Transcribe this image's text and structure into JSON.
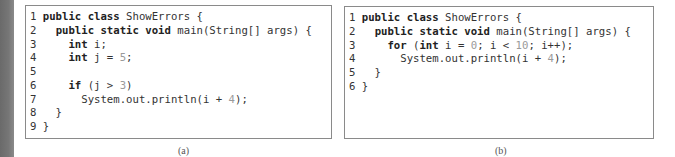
{
  "figure_a": {
    "caption": "(a)",
    "lines": [
      {
        "n": "1",
        "tokens": [
          [
            "kw",
            "public"
          ],
          [
            "t",
            " "
          ],
          [
            "kw",
            "class"
          ],
          [
            "t",
            " ShowErrors {"
          ]
        ]
      },
      {
        "n": "2",
        "tokens": [
          [
            "t",
            "  "
          ],
          [
            "kw",
            "public"
          ],
          [
            "t",
            " "
          ],
          [
            "kw",
            "static"
          ],
          [
            "t",
            " "
          ],
          [
            "kw",
            "void"
          ],
          [
            "t",
            " main(String[] args) {"
          ]
        ]
      },
      {
        "n": "3",
        "tokens": [
          [
            "t",
            "    "
          ],
          [
            "kw",
            "int"
          ],
          [
            "t",
            " i;"
          ]
        ]
      },
      {
        "n": "4",
        "tokens": [
          [
            "t",
            "    "
          ],
          [
            "kw",
            "int"
          ],
          [
            "t",
            " j = "
          ],
          [
            "lit",
            "5"
          ],
          [
            "t",
            ";"
          ]
        ]
      },
      {
        "n": "5",
        "tokens": []
      },
      {
        "n": "6",
        "tokens": [
          [
            "t",
            "    "
          ],
          [
            "kw",
            "if"
          ],
          [
            "t",
            " (j > "
          ],
          [
            "lit",
            "3"
          ],
          [
            "t",
            ")"
          ]
        ]
      },
      {
        "n": "7",
        "tokens": [
          [
            "t",
            "      System.out.println(i + "
          ],
          [
            "lit",
            "4"
          ],
          [
            "t",
            ");"
          ]
        ]
      },
      {
        "n": "8",
        "tokens": [
          [
            "t",
            "  }"
          ]
        ]
      },
      {
        "n": "9",
        "tokens": [
          [
            "t",
            "}"
          ]
        ]
      }
    ]
  },
  "figure_b": {
    "caption": "(b)",
    "lines": [
      {
        "n": "1",
        "tokens": [
          [
            "kw",
            "public"
          ],
          [
            "t",
            " "
          ],
          [
            "kw",
            "class"
          ],
          [
            "t",
            " ShowErrors {"
          ]
        ]
      },
      {
        "n": "2",
        "tokens": [
          [
            "t",
            "  "
          ],
          [
            "kw",
            "public"
          ],
          [
            "t",
            " "
          ],
          [
            "kw",
            "static"
          ],
          [
            "t",
            " "
          ],
          [
            "kw",
            "void"
          ],
          [
            "t",
            " main(String[] args) {"
          ]
        ]
      },
      {
        "n": "3",
        "tokens": [
          [
            "t",
            "    "
          ],
          [
            "kw",
            "for"
          ],
          [
            "t",
            " ("
          ],
          [
            "kw",
            "int"
          ],
          [
            "t",
            " i = "
          ],
          [
            "lit",
            "0"
          ],
          [
            "t",
            "; i < "
          ],
          [
            "lit",
            "10"
          ],
          [
            "t",
            "; i++);"
          ]
        ]
      },
      {
        "n": "4",
        "tokens": [
          [
            "t",
            "      System.out.println(i + "
          ],
          [
            "lit",
            "4"
          ],
          [
            "t",
            ");"
          ]
        ]
      },
      {
        "n": "5",
        "tokens": [
          [
            "t",
            "  }"
          ]
        ]
      },
      {
        "n": "6",
        "tokens": [
          [
            "t",
            "}"
          ]
        ]
      }
    ]
  },
  "colors": {
    "border": "#8a8a8a",
    "text": "#333333",
    "literal": "#9a9a9a",
    "edge_strip": "#707070"
  }
}
